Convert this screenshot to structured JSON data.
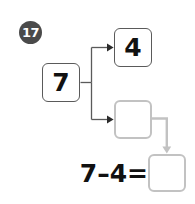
{
  "worksheet": {
    "question_number": "17",
    "type": "number-bond-subtraction",
    "whole": {
      "value": "7",
      "filled": true
    },
    "parts": [
      {
        "value": "4",
        "filled": true
      },
      {
        "value": "",
        "filled": false
      }
    ],
    "equation": {
      "text": "7–4=",
      "left_operand": "7",
      "operator": "–",
      "right_operand": "4",
      "equals": "=",
      "answer": "",
      "answer_filled": false
    },
    "colors": {
      "badge_background": "#4a4a4a",
      "badge_text": "#ffffff",
      "filled_box_border": "#5a5a5a",
      "blank_box_border": "#c2c2c2",
      "connector_dark": "#555555",
      "connector_gray": "#c2c2c2",
      "text": "#111111",
      "page_background": "#ffffff"
    }
  }
}
